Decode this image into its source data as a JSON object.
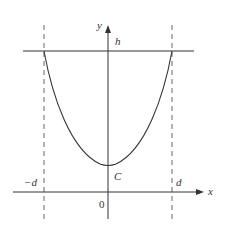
{
  "diagram": {
    "type": "catenary-curve-plot",
    "axes": {
      "x_label": "x",
      "y_label": "y",
      "origin_label": "0"
    },
    "labels": {
      "top_line": "h",
      "minimum": "C",
      "left_bound": "−d",
      "right_bound": "d"
    },
    "colors": {
      "stroke": "#333333",
      "dashed": "#555555",
      "background": "#ffffff"
    }
  }
}
